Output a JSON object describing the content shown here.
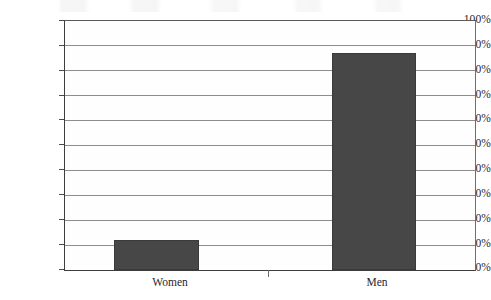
{
  "chart_data": {
    "type": "bar",
    "title": "",
    "subtitle": "",
    "xlabel": "",
    "ylabel": "",
    "categories": [
      "Women",
      "Men"
    ],
    "values": [
      12,
      87
    ],
    "value_labels": [
      "12%",
      "87%"
    ],
    "ylim": [
      0,
      100
    ],
    "ytick_values": [
      100,
      90,
      80,
      70,
      60,
      50,
      40,
      30,
      20,
      10,
      0
    ],
    "ytick_labels": [
      "100%",
      "90%",
      "80%",
      "70%",
      "60%",
      "50%",
      "40%",
      "30%",
      "20%",
      "10%",
      "0%"
    ],
    "grid": true,
    "grid_axis": "y",
    "legend": false,
    "legend_position": "none",
    "series": [
      {
        "name": "",
        "values": [
          12,
          87
        ],
        "color": "#474747"
      }
    ],
    "annotations": []
  },
  "style": {
    "bar_color": "#474747",
    "bar_border_color": "#3a3a3a",
    "gridline_color": "#8d8d8d",
    "axis_color": "#3d3d3d",
    "plot_background": "#fefefe",
    "page_background": "#ffffff",
    "text_color": "#27272a"
  },
  "geometry": {
    "plot_left": 64,
    "plot_top": 20,
    "plot_width": 410,
    "plot_height": 249,
    "bars": [
      {
        "category": "Women",
        "left": 49,
        "width": 85,
        "height_pct": 12
      },
      {
        "category": "Men",
        "left": 267,
        "width": 84,
        "height_pct": 87
      }
    ],
    "category_tick_x": 268,
    "x_label_centers": [
      170,
      377
    ]
  }
}
